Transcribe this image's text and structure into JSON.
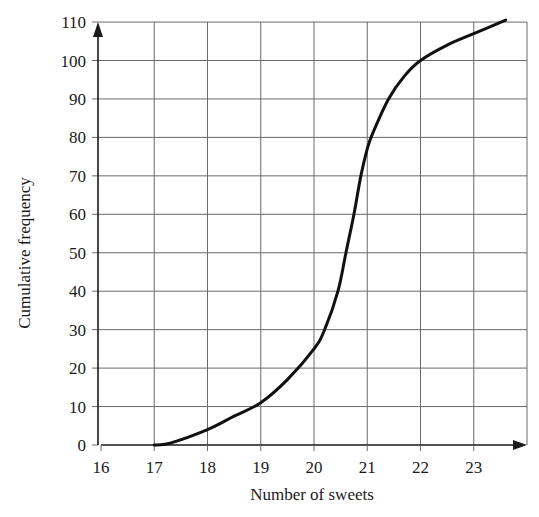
{
  "chart_data": {
    "type": "line",
    "title": "",
    "xlabel": "Number of sweets",
    "ylabel": "Cumulative frequency",
    "xlim": [
      16,
      24
    ],
    "ylim": [
      0,
      110
    ],
    "x_ticks": [
      16,
      17,
      18,
      19,
      20,
      21,
      22,
      23
    ],
    "y_ticks": [
      0,
      10,
      20,
      30,
      40,
      50,
      60,
      70,
      80,
      90,
      100,
      110
    ],
    "grid": true,
    "legend": null,
    "series": [
      {
        "name": "Cumulative frequency curve",
        "x": [
          17,
          17.3,
          18,
          18.5,
          19,
          19.5,
          20,
          20.2,
          20.45,
          20.6,
          20.75,
          20.88,
          21,
          21.1,
          21.4,
          21.7,
          22,
          22.5,
          23,
          23.6
        ],
        "y": [
          0,
          0.5,
          4,
          7.5,
          11,
          17,
          25,
          30,
          40,
          50,
          60,
          70,
          77,
          81,
          90,
          96,
          100,
          104,
          107,
          110.5
        ]
      }
    ]
  },
  "colors": {
    "curve": "#111111",
    "grid": "#6a6a6a",
    "axis": "#1a1a1a",
    "background": "#ffffff"
  }
}
